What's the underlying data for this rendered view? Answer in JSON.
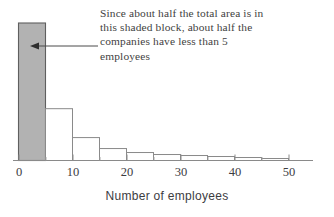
{
  "chart_data": {
    "type": "bar",
    "title": "",
    "subtitle": "",
    "xlabel": "Number of employees",
    "ylabel": "",
    "xlim": [
      0,
      53
    ],
    "ylim": [
      0,
      1
    ],
    "grid": false,
    "legend": null,
    "bin_width": 5,
    "bin_edges": [
      0,
      5,
      10,
      15,
      20,
      25,
      30,
      35,
      40,
      45,
      50
    ],
    "categories": [
      "0-5",
      "5-10",
      "10-15",
      "15-20",
      "20-25",
      "25-30",
      "30-35",
      "35-40",
      "40-45",
      "45-50"
    ],
    "values": [
      0.138,
      0.052,
      0.023,
      0.012,
      0.008,
      0.006,
      0.005,
      0.004,
      0.003,
      0.002
    ],
    "bars": [
      {
        "x0": 0,
        "x1": 5,
        "height": 0.138,
        "shaded": true
      },
      {
        "x0": 5,
        "x1": 10,
        "height": 0.052,
        "shaded": false
      },
      {
        "x0": 10,
        "x1": 15,
        "height": 0.023,
        "shaded": false
      },
      {
        "x0": 15,
        "x1": 20,
        "height": 0.012,
        "shaded": false
      },
      {
        "x0": 20,
        "x1": 25,
        "height": 0.008,
        "shaded": false
      },
      {
        "x0": 25,
        "x1": 30,
        "height": 0.006,
        "shaded": false
      },
      {
        "x0": 30,
        "x1": 35,
        "height": 0.005,
        "shaded": false
      },
      {
        "x0": 35,
        "x1": 40,
        "height": 0.004,
        "shaded": false
      },
      {
        "x0": 40,
        "x1": 45,
        "height": 0.003,
        "shaded": false
      },
      {
        "x0": 45,
        "x1": 50,
        "height": 0.002,
        "shaded": false
      }
    ],
    "xticks": [
      0,
      10,
      20,
      30,
      40,
      50
    ],
    "xtick_labels": [
      "0",
      "10",
      "20",
      "30",
      "40",
      "50"
    ],
    "xminor_ticks": [
      5,
      15,
      25,
      35,
      45
    ],
    "annotations": [
      {
        "name": "shaded-block-note",
        "lines": [
          "Since about half the total area is in",
          "this shaded block, about half the",
          "companies have less than 5",
          "employees"
        ],
        "arrow": {
          "from_x": 98,
          "from_y": 46,
          "to_x": 32,
          "to_y": 46,
          "direction": "left"
        }
      }
    ],
    "colors": {
      "shaded_fill": "#b2b2b2",
      "shaded_stroke": "#5f5f5f",
      "bar_fill": "#ffffff",
      "bar_stroke": "#8a8a8a",
      "axis": "#8a8a8a",
      "text": "#3c3c3f",
      "annotation_text": "#3f3f42",
      "arrow": "#4a4a4a",
      "background": "#ffffff"
    }
  }
}
